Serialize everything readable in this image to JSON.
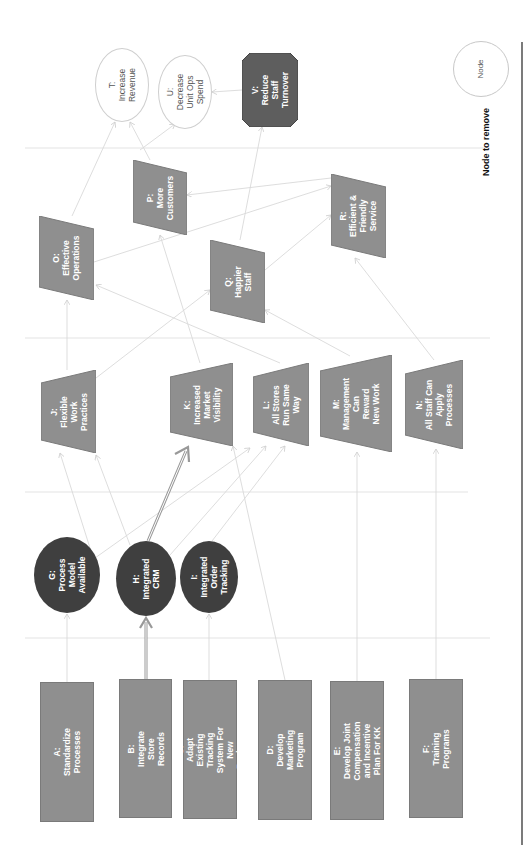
{
  "diagram": {
    "orientation": "rotated -90 degrees (reads bottom-to-top)",
    "colors": {
      "initiative_fill": "#8f8f8f",
      "intermediate_fill": "#3f3f3f",
      "outcome_fill": "#8f8f8f",
      "goal_fill": "#ffffff",
      "highlight_node_fill": "#5e5e5e",
      "edge": "#d6d6d6",
      "highlight_edge": "#999999",
      "separator": "#e6e6e6"
    },
    "nodes": {
      "A": {
        "id": "A",
        "text": "A:\nStandardize Processes",
        "shape": "rectangle"
      },
      "B": {
        "id": "B",
        "text": "B:\nIntegrate Store\nRecords",
        "shape": "rectangle"
      },
      "C": {
        "id": "C",
        "text": "C:\nAdapt Existing Tracking\nSystem For New Business",
        "shape": "rectangle"
      },
      "D": {
        "id": "D",
        "text": "D:\nDevelop Marketing\nProgram",
        "shape": "rectangle"
      },
      "E": {
        "id": "E",
        "text": "E:\nDevelop Joint Compensation\nand Incentive Plan For KK",
        "shape": "rectangle"
      },
      "F": {
        "id": "F",
        "text": "F:\nTraining Programs",
        "shape": "rectangle"
      },
      "G": {
        "id": "G",
        "text": "G:\nProcess\nModel\nAvailable",
        "shape": "ellipse"
      },
      "H": {
        "id": "H",
        "text": "H:\nIntegrated\nCRM",
        "shape": "ellipse"
      },
      "I": {
        "id": "I",
        "text": "I:\nIntegrated\nOrder\nTracking",
        "shape": "ellipse"
      },
      "J": {
        "id": "J",
        "text": "J:\nFlexible\nWork\nPractices",
        "shape": "trapezoid"
      },
      "K": {
        "id": "K",
        "text": "K:\nIncreased\nMarket\nVisibility",
        "shape": "trapezoid"
      },
      "L": {
        "id": "L",
        "text": "L:\nAll Stores\nRun Same\nWay",
        "shape": "trapezoid"
      },
      "M": {
        "id": "M",
        "text": "M:\nManagement\nCan\nReward\nNew Work",
        "shape": "trapezoid"
      },
      "N": {
        "id": "N",
        "text": "N:\nAll Staff Can\nApply\nProcesses",
        "shape": "trapezoid"
      },
      "O": {
        "id": "O",
        "text": "O:\nEffective\nOperations",
        "shape": "parallelogram"
      },
      "P": {
        "id": "P",
        "text": "P:\nMore\nCustomers",
        "shape": "parallelogram"
      },
      "Q": {
        "id": "Q",
        "text": "Q:\nHappier\nStaff",
        "shape": "parallelogram"
      },
      "R": {
        "id": "R",
        "text": "R:\nEfficient &\nFriendly\nService",
        "shape": "parallelogram"
      },
      "T": {
        "id": "T",
        "text": "T:\nIncrease\nRevenue",
        "shape": "ellipse"
      },
      "U": {
        "id": "U",
        "text": "U:\nDecrease\nUnit Ops\nSpend",
        "shape": "ellipse"
      },
      "V": {
        "id": "V",
        "text": "V:\nReduce\nStaff\nTurnover",
        "shape": "octagon"
      }
    },
    "edges": [
      {
        "from": "A",
        "to": "G"
      },
      {
        "from": "B",
        "to": "H",
        "highlight": true
      },
      {
        "from": "C",
        "to": "I"
      },
      {
        "from": "D",
        "to": "K"
      },
      {
        "from": "E",
        "to": "M"
      },
      {
        "from": "F",
        "to": "N"
      },
      {
        "from": "G",
        "to": "J"
      },
      {
        "from": "G",
        "to": "L"
      },
      {
        "from": "H",
        "to": "K",
        "highlight": true
      },
      {
        "from": "H",
        "to": "J"
      },
      {
        "from": "H",
        "to": "L"
      },
      {
        "from": "I",
        "to": "L"
      },
      {
        "from": "J",
        "to": "O"
      },
      {
        "from": "J",
        "to": "Q"
      },
      {
        "from": "K",
        "to": "P"
      },
      {
        "from": "L",
        "to": "O"
      },
      {
        "from": "M",
        "to": "Q"
      },
      {
        "from": "N",
        "to": "R"
      },
      {
        "from": "O",
        "to": "R"
      },
      {
        "from": "O",
        "to": "T"
      },
      {
        "from": "P",
        "to": "T"
      },
      {
        "from": "Q",
        "to": "V"
      },
      {
        "from": "Q",
        "to": "R"
      },
      {
        "from": "R",
        "to": "P"
      },
      {
        "from": "V",
        "to": "U"
      },
      {
        "from": "O",
        "to": "U"
      }
    ],
    "legend": {
      "node_label": "Node",
      "caption": "Node to remove"
    }
  }
}
